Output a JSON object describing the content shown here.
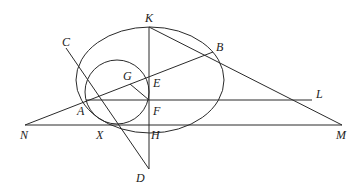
{
  "diagram": {
    "type": "geometry",
    "points": {
      "K": {
        "label": "K",
        "x": 149,
        "y": 27,
        "lx": 145,
        "ly": 22
      },
      "B": {
        "label": "B",
        "x": 213,
        "y": 52,
        "lx": 216,
        "ly": 51
      },
      "C": {
        "label": "C",
        "x": 66,
        "y": 48,
        "lx": 62,
        "ly": 46
      },
      "G": {
        "label": "G",
        "x": 130,
        "y": 84,
        "lx": 123,
        "ly": 80
      },
      "E": {
        "label": "E",
        "x": 149,
        "y": 85,
        "lx": 153,
        "ly": 87
      },
      "A": {
        "label": "A",
        "x": 86,
        "y": 100,
        "lx": 77,
        "ly": 115
      },
      "F": {
        "label": "F",
        "x": 149,
        "y": 100,
        "lx": 153,
        "ly": 115
      },
      "L": {
        "label": "L",
        "x": 312,
        "y": 100,
        "lx": 316,
        "ly": 98
      },
      "N": {
        "label": "N",
        "x": 25,
        "y": 125,
        "lx": 20,
        "ly": 139
      },
      "X": {
        "label": "X",
        "x": 110,
        "y": 125,
        "lx": 96,
        "ly": 139
      },
      "H": {
        "label": "H",
        "x": 149,
        "y": 125,
        "lx": 151,
        "ly": 139
      },
      "M": {
        "label": "M",
        "x": 342,
        "y": 125,
        "lx": 336,
        "ly": 139
      },
      "D": {
        "label": "D",
        "x": 149,
        "y": 169,
        "lx": 136,
        "ly": 182
      }
    },
    "ellipse": {
      "cx": 150,
      "cy": 80,
      "rx": 74,
      "ry": 53
    },
    "circle": {
      "cx": 117,
      "cy": 92,
      "r": 32
    },
    "segments": [
      [
        "K",
        "D"
      ],
      [
        "K",
        "M"
      ],
      [
        "N",
        "B"
      ],
      [
        "N",
        "M"
      ],
      [
        "A",
        "L"
      ],
      [
        "C",
        "D"
      ],
      [
        "G",
        "F"
      ]
    ]
  }
}
